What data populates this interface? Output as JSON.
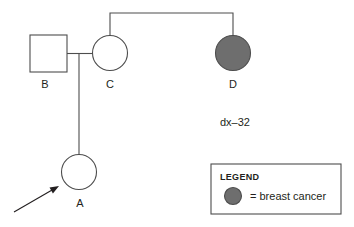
{
  "diagram": {
    "type": "pedigree-chart",
    "title": "",
    "background_color": "#ffffff",
    "line_color": "#4d4d4d",
    "text_color": "#231f20",
    "affected_fill_color": "#6e6e6e",
    "unaffected_fill_color": "#ffffff"
  },
  "individuals": [
    {
      "id": "B",
      "label": "B",
      "sex": "male",
      "shape": "square",
      "affected": false,
      "cx": 48.5,
      "cy": 53.5,
      "size": 37,
      "label_x": 45,
      "label_y": 88
    },
    {
      "id": "C",
      "label": "C",
      "sex": "female",
      "shape": "circle",
      "affected": false,
      "cx": 110,
      "cy": 53,
      "r": 17.5,
      "label_x": 110,
      "label_y": 88
    },
    {
      "id": "D",
      "label": "D",
      "sex": "female",
      "shape": "circle",
      "affected": true,
      "cx": 233,
      "cy": 53,
      "r": 17.5,
      "label_x": 233,
      "label_y": 88
    },
    {
      "id": "A",
      "label": "A",
      "sex": "female",
      "shape": "circle",
      "affected": false,
      "cx": 79,
      "cy": 172,
      "r": 17.5,
      "label_x": 80,
      "label_y": 207,
      "proband": true
    }
  ],
  "connections": {
    "sibship_line": {
      "description": "horizontal sibship line joining C and D",
      "y": 13,
      "x_start": 110,
      "x_end": 233,
      "drop_bottom_y": 35.5
    },
    "mating_line": {
      "description": "horizontal mating line between B and C",
      "y": 53.5,
      "x_start": 67,
      "x_end": 92.5
    },
    "descent_line": {
      "description": "vertical descent line from B-C union down to A",
      "x": 79,
      "y_start": 53.5,
      "y_end": 154.5
    }
  },
  "proband_arrow": {
    "tail_x": 14,
    "tail_y": 212,
    "tip_x": 59,
    "tip_y": 186,
    "name": "proband-arrow"
  },
  "annotations": [
    {
      "id": "dx-32",
      "text": "dx–32",
      "x": 235,
      "y": 126,
      "refers_to": "D"
    }
  ],
  "legend": {
    "title": "LEGEND",
    "box": {
      "x": 211,
      "y": 164,
      "width": 130,
      "height": 50
    },
    "title_x": 220,
    "title_y": 180,
    "entries": [
      {
        "symbol": "filled-circle",
        "symbol_cx": 233,
        "symbol_cy": 196,
        "symbol_r": 8.5,
        "symbol_color": "#6e6e6e",
        "label": "= breast cancer",
        "label_x": 250,
        "label_y": 200
      }
    ]
  }
}
